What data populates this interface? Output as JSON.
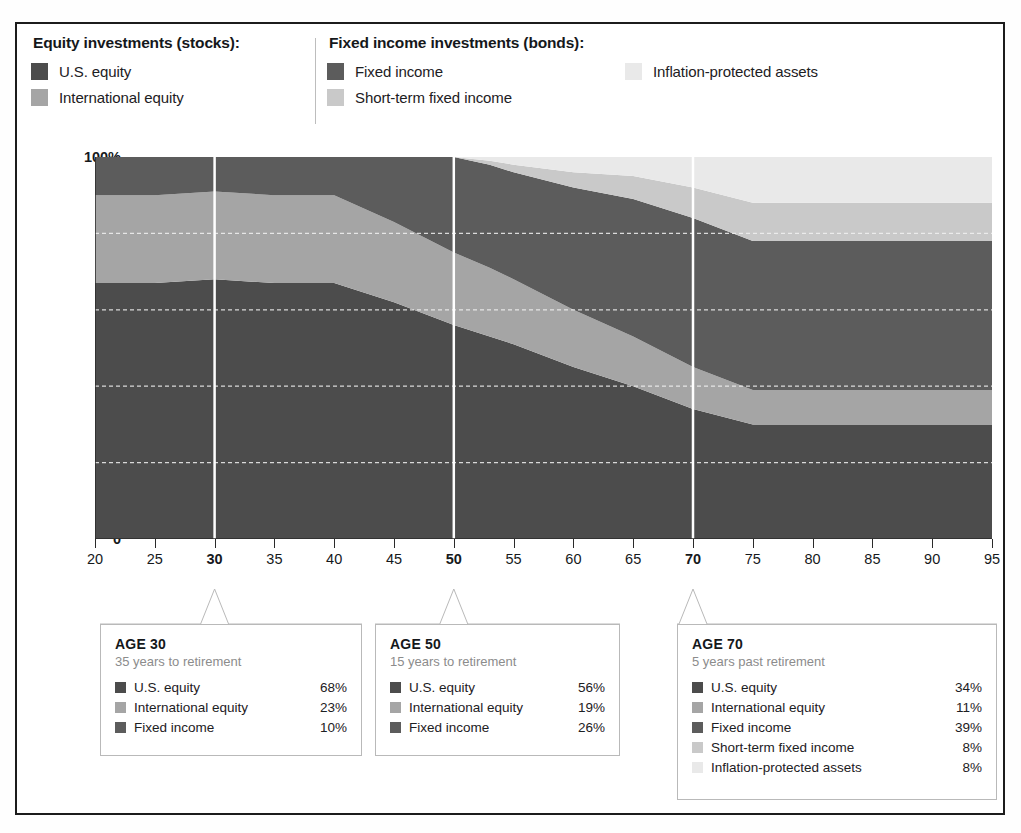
{
  "colors": {
    "us_equity": "#4c4c4c",
    "intl_equity": "#a5a5a5",
    "fixed_income": "#5c5c5c",
    "short_term_fixed": "#c9c9c9",
    "inflation_protected": "#e9e9e9",
    "frame": "#1c1c1c",
    "gridline": "#f2f2f2",
    "marker_line": "#ffffff",
    "callout_border": "#b9b9b9",
    "muted_text": "#8c8c8c"
  },
  "legend": {
    "groups": [
      {
        "title": "Equity investments (stocks):",
        "items": [
          {
            "label": "U.S. equity",
            "key": "us_equity"
          },
          {
            "label": "International equity",
            "key": "intl_equity"
          }
        ]
      },
      {
        "title": "Fixed income investments (bonds):",
        "items": [
          {
            "label": "Fixed income",
            "key": "fixed_income"
          },
          {
            "label": "Short-term fixed income",
            "key": "short_term_fixed"
          }
        ]
      },
      {
        "title": "",
        "items": [
          {
            "label": "Inflation-protected assets",
            "key": "inflation_protected"
          }
        ]
      }
    ]
  },
  "callouts": [
    {
      "title": "AGE 30",
      "subtitle": "35 years to retirement",
      "age": 30,
      "rows": [
        {
          "label": "U.S. equity",
          "value": "68%",
          "key": "us_equity"
        },
        {
          "label": "International equity",
          "value": "23%",
          "key": "intl_equity"
        },
        {
          "label": "Fixed income",
          "value": "10%",
          "key": "fixed_income"
        }
      ]
    },
    {
      "title": "AGE 50",
      "subtitle": "15 years to retirement",
      "age": 50,
      "rows": [
        {
          "label": "U.S. equity",
          "value": "56%",
          "key": "us_equity"
        },
        {
          "label": "International equity",
          "value": "19%",
          "key": "intl_equity"
        },
        {
          "label": "Fixed income",
          "value": "26%",
          "key": "fixed_income"
        }
      ]
    },
    {
      "title": "AGE 70",
      "subtitle": "5 years past retirement",
      "age": 70,
      "rows": [
        {
          "label": "U.S. equity",
          "value": "34%",
          "key": "us_equity"
        },
        {
          "label": "International equity",
          "value": "11%",
          "key": "intl_equity"
        },
        {
          "label": "Fixed income",
          "value": "39%",
          "key": "fixed_income"
        },
        {
          "label": "Short-term fixed income",
          "value": "8%",
          "key": "short_term_fixed"
        },
        {
          "label": "Inflation-protected assets",
          "value": "8%",
          "key": "inflation_protected"
        }
      ]
    }
  ],
  "chart_data": {
    "type": "area",
    "stacked": true,
    "title": "",
    "xlabel": "",
    "ylabel": "",
    "xlim": [
      20,
      95
    ],
    "ylim": [
      0,
      100
    ],
    "grid": true,
    "legend_position": "top",
    "xticks": [
      20,
      25,
      30,
      35,
      40,
      45,
      50,
      55,
      60,
      65,
      70,
      75,
      80,
      85,
      90,
      95
    ],
    "xticks_bold": [
      30,
      50,
      70
    ],
    "ytick_labels": [
      "0",
      "20",
      "40",
      "60",
      "80",
      "100%"
    ],
    "yticks": [
      0,
      20,
      40,
      60,
      80,
      100
    ],
    "marker_ages": [
      30,
      50,
      70
    ],
    "x": [
      20,
      25,
      30,
      35,
      40,
      45,
      50,
      53,
      55,
      60,
      65,
      70,
      75,
      80,
      85,
      90,
      95
    ],
    "series": [
      {
        "name": "U.S. equity",
        "key": "us_equity",
        "values": [
          67,
          67,
          68,
          67,
          67,
          62,
          56,
          53,
          51,
          45,
          40,
          34,
          30,
          30,
          30,
          30,
          30
        ]
      },
      {
        "name": "International equity",
        "key": "intl_equity",
        "values": [
          23,
          23,
          23,
          23,
          23,
          21,
          19,
          18,
          17,
          15,
          13,
          11,
          9,
          9,
          9,
          9,
          9
        ]
      },
      {
        "name": "Fixed income",
        "key": "fixed_income",
        "values": [
          10,
          10,
          10,
          10,
          10,
          17,
          25,
          27,
          28,
          32,
          36,
          39,
          39,
          39,
          39,
          39,
          39
        ]
      },
      {
        "name": "Short-term fixed income",
        "key": "short_term_fixed",
        "values": [
          0,
          0,
          0,
          0,
          0,
          0,
          0,
          1,
          2,
          4,
          6,
          8,
          10,
          10,
          10,
          10,
          10
        ]
      },
      {
        "name": "Inflation-protected assets",
        "key": "inflation_protected",
        "values": [
          0,
          0,
          0,
          0,
          0,
          0,
          0,
          1,
          2,
          4,
          5,
          8,
          12,
          12,
          12,
          12,
          12
        ]
      }
    ]
  }
}
